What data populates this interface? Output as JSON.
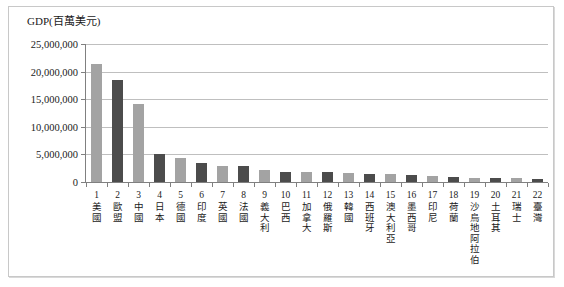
{
  "chart_data": {
    "type": "bar",
    "title": "GDP(百萬美元)",
    "xlabel": "",
    "ylabel": "GDP(百萬美元)",
    "ylim": [
      0,
      25000000
    ],
    "grid": true,
    "legend": null,
    "ytick_labels": [
      "25,000,000",
      "20,000,000",
      "15,000,000",
      "10,000,000",
      "5,000,000",
      "0"
    ],
    "ytick_values": [
      25000000,
      20000000,
      15000000,
      10000000,
      5000000,
      0
    ],
    "ranks": [
      "1",
      "2",
      "3",
      "4",
      "5",
      "6",
      "7",
      "8",
      "9",
      "10",
      "11",
      "12",
      "13",
      "14",
      "15",
      "16",
      "17",
      "18",
      "19",
      "20",
      "21",
      "22"
    ],
    "categories": [
      "美國",
      "歐盟",
      "中國",
      "日本",
      "德國",
      "印度",
      "英國",
      "法國",
      "義大利",
      "巴西",
      "加拿大",
      "俄羅斯",
      "韓國",
      "西班牙",
      "澳大利亞",
      "墨西哥",
      "印尼",
      "荷蘭",
      "沙烏地阿拉伯",
      "土耳其",
      "瑞士",
      "臺灣"
    ],
    "values": [
      21400000,
      18500000,
      14200000,
      5080000,
      4400000,
      3500000,
      2900000,
      2900000,
      2100000,
      1850000,
      1800000,
      1750000,
      1700000,
      1500000,
      1450000,
      1300000,
      1100000,
      950000,
      800000,
      780000,
      720000,
      600000
    ],
    "bar_colors": [
      "#a3a3a3",
      "#4c4c4c",
      "#a3a3a3",
      "#4c4c4c",
      "#a3a3a3",
      "#4c4c4c",
      "#a3a3a3",
      "#4c4c4c",
      "#a3a3a3",
      "#4c4c4c",
      "#a3a3a3",
      "#4c4c4c",
      "#a3a3a3",
      "#4c4c4c",
      "#a3a3a3",
      "#4c4c4c",
      "#a3a3a3",
      "#4c4c4c",
      "#a3a3a3",
      "#4c4c4c",
      "#a3a3a3",
      "#4c4c4c"
    ]
  },
  "style": {
    "light_bar": "#a3a3a3",
    "dark_bar": "#4c4c4c",
    "gridline": "#bfbfbf",
    "axis": "#808080",
    "frame": "#c8c8c8",
    "text": "#1a1a1a",
    "background": "#ffffff"
  }
}
